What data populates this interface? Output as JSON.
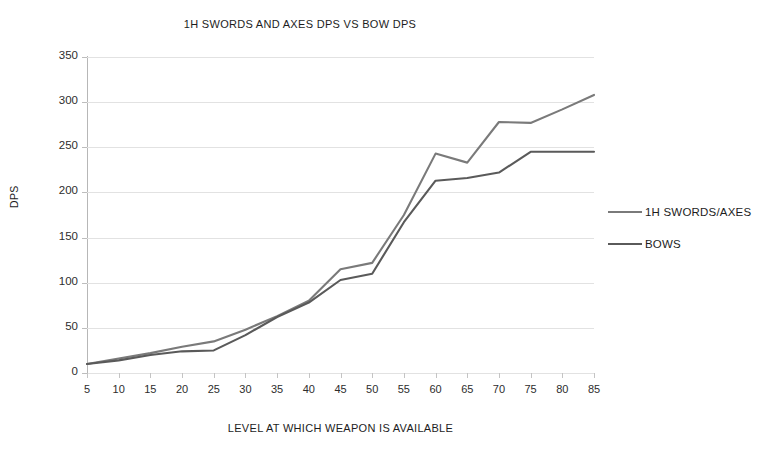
{
  "chart_data": {
    "type": "line",
    "title": "1H SWORDS AND AXES DPS VS BOW DPS",
    "xlabel": "LEVEL AT WHICH WEAPON IS AVAILABLE",
    "ylabel": "DPS",
    "categories": [
      5,
      10,
      15,
      20,
      25,
      30,
      35,
      40,
      45,
      50,
      55,
      60,
      65,
      70,
      75,
      80,
      85
    ],
    "x_tick_labels": [
      "5",
      "10",
      "15",
      "20",
      "25",
      "30",
      "35",
      "40",
      "45",
      "50",
      "55",
      "60",
      "65",
      "70",
      "75",
      "80",
      "85"
    ],
    "y_tick_labels": [
      "0",
      "50",
      "100",
      "150",
      "200",
      "250",
      "300",
      "350"
    ],
    "y_ticks": [
      0,
      50,
      100,
      150,
      200,
      250,
      300,
      350
    ],
    "ylim": [
      0,
      350
    ],
    "grid": "horizontal",
    "legend_position": "right",
    "series": [
      {
        "name": "1H SWORDS/AXES",
        "color": "#7a7a7a",
        "values": [
          10,
          16,
          22,
          29,
          35,
          48,
          63,
          80,
          115,
          122,
          175,
          243,
          233,
          278,
          277,
          292,
          308
        ]
      },
      {
        "name": "BOWS",
        "color": "#5a5a5a",
        "values": [
          10,
          14,
          20,
          24,
          25,
          42,
          62,
          78,
          103,
          110,
          167,
          213,
          216,
          222,
          245,
          245,
          245
        ]
      }
    ]
  },
  "legend": {
    "items": [
      {
        "label": "1H SWORDS/AXES"
      },
      {
        "label": "BOWS"
      }
    ]
  },
  "colors": {
    "series_swords": "#7a7a7a",
    "series_bows": "#5a5a5a",
    "gridline": "#e2e2e2",
    "axis": "#b7b7b7",
    "background": "#ffffff",
    "text": "#1d1d1d"
  }
}
